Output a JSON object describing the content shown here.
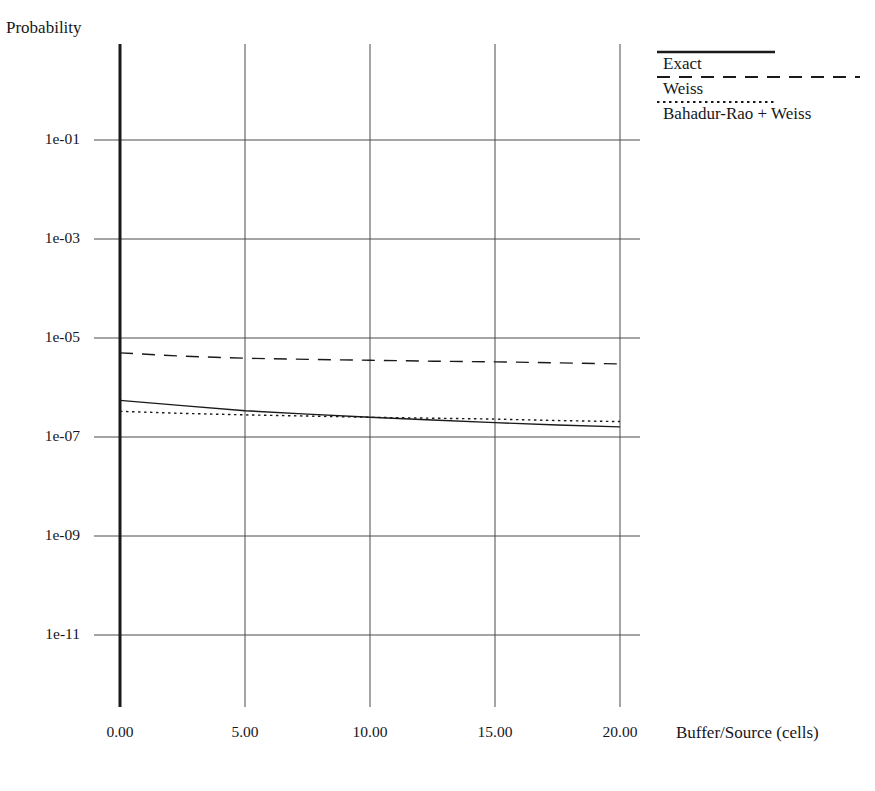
{
  "chart_data": {
    "type": "line",
    "title": "",
    "xlabel": "Buffer/Source (cells)",
    "ylabel": "Probability",
    "xlim": [
      0,
      20
    ],
    "ylim": [
      1e-12,
      1.0
    ],
    "yscale": "log",
    "grid": true,
    "legend_position": "top-right",
    "xticks": [
      "0.00",
      "5.00",
      "10.00",
      "15.00",
      "20.00"
    ],
    "xtick_values": [
      0,
      5,
      10,
      15,
      20
    ],
    "yticks": [
      "1e-01",
      "1e-03",
      "1e-05",
      "1e-07",
      "1e-09",
      "1e-11"
    ],
    "ytick_values": [
      0.1,
      0.001,
      1e-05,
      1e-07,
      1e-09,
      1e-11
    ],
    "x": [
      0,
      2.5,
      5,
      7.5,
      10,
      12.5,
      15,
      17.5,
      20
    ],
    "series": [
      {
        "name": "Exact",
        "style": "solid",
        "color": "#1a1a1a",
        "values": [
          5.5e-07,
          4.3e-07,
          3.4e-07,
          2.9e-07,
          2.5e-07,
          2.2e-07,
          1.95e-07,
          1.75e-07,
          1.6e-07
        ]
      },
      {
        "name": "Weiss",
        "style": "dashed",
        "color": "#1a1a1a",
        "values": [
          5e-06,
          4.3e-06,
          3.9e-06,
          3.7e-06,
          3.55e-06,
          3.4e-06,
          3.3e-06,
          3.15e-06,
          3e-06
        ]
      },
      {
        "name": "Bahadur-Rao + Weiss",
        "style": "dotted",
        "color": "#1a1a1a",
        "values": [
          3.3e-07,
          3e-07,
          2.8e-07,
          2.65e-07,
          2.5e-07,
          2.4e-07,
          2.3e-07,
          2.15e-07,
          2.05e-07
        ]
      }
    ]
  },
  "axes": {
    "plot_left_px": 120,
    "plot_right_px": 620,
    "plot_top_px": 44,
    "plot_bottom_px": 707,
    "y_top_value_px": 140,
    "y_bottom_value_px": 635
  },
  "legend": {
    "items": [
      {
        "label": "Exact",
        "style": "solid"
      },
      {
        "label": "Weiss",
        "style": "dashed"
      },
      {
        "label": "Bahadur-Rao + Weiss",
        "style": "dotted"
      }
    ]
  }
}
